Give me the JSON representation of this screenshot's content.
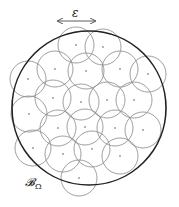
{
  "diagram": {
    "epsilon_label": "ε",
    "domain_label": "𝓑",
    "domain_subscript": "Ω",
    "big_circle": {
      "cx": 89,
      "cy": 108,
      "r": 77,
      "stroke": "#222222",
      "stroke_width": 1.6
    },
    "small_radius": 18,
    "small_stroke": "#888888",
    "arrow": {
      "x1": 58,
      "x2": 95,
      "y": 21
    },
    "centers": [
      [
        76,
        45
      ],
      [
        103,
        47
      ],
      [
        28,
        79
      ],
      [
        55,
        69
      ],
      [
        86,
        71
      ],
      [
        120,
        69
      ],
      [
        148,
        74
      ],
      [
        53,
        98
      ],
      [
        81,
        102
      ],
      [
        107,
        100
      ],
      [
        134,
        100
      ],
      [
        29,
        114
      ],
      [
        58,
        128
      ],
      [
        85,
        127
      ],
      [
        115,
        128
      ],
      [
        143,
        130
      ],
      [
        33,
        148
      ],
      [
        63,
        154
      ],
      [
        92,
        149
      ],
      [
        120,
        156
      ],
      [
        79,
        178
      ]
    ]
  }
}
